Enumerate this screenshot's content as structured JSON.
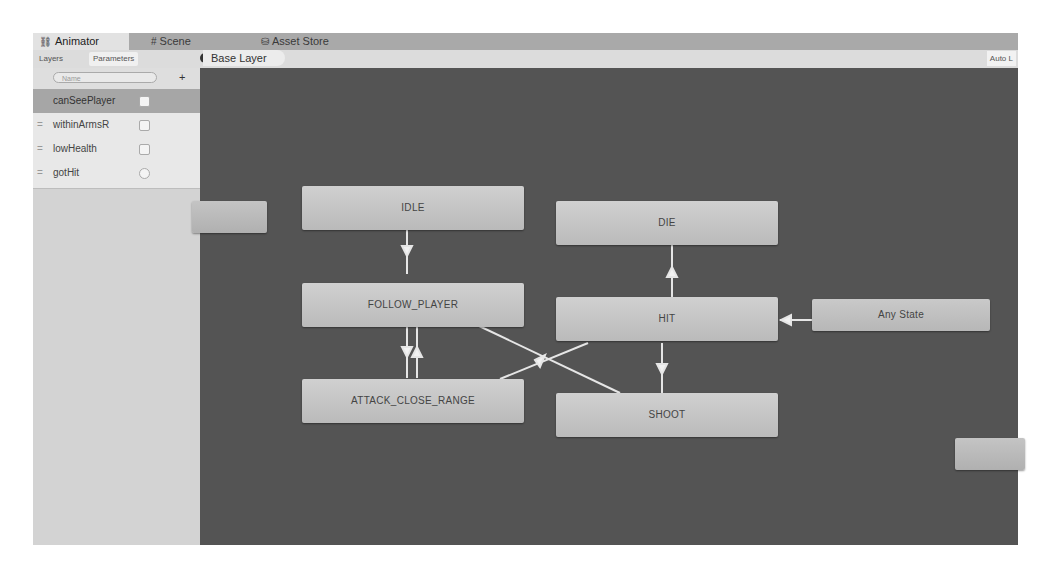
{
  "window": {
    "tabs": [
      {
        "label": "Animator",
        "icon": "animator-icon",
        "active": true
      },
      {
        "label": "Scene",
        "icon": "scene-icon",
        "active": false
      },
      {
        "label": "Asset Store",
        "icon": "asset-store-icon",
        "active": false
      }
    ]
  },
  "toolbar": {
    "subtabs": [
      {
        "label": "Layers",
        "active": false
      },
      {
        "label": "Parameters",
        "active": true
      }
    ],
    "eye_icon": "eye-icon",
    "breadcrumb": "Base Layer",
    "auto_live_label": "Auto L"
  },
  "sidebar": {
    "search_placeholder": "Name",
    "add_label": "+",
    "parameters": [
      {
        "name": "canSeePlayer",
        "type": "bool",
        "selected": true
      },
      {
        "name": "withinArmsR",
        "type": "bool",
        "selected": false
      },
      {
        "name": "lowHealth",
        "type": "bool",
        "selected": false
      },
      {
        "name": "gotHit",
        "type": "trigger",
        "selected": false
      }
    ]
  },
  "canvas": {
    "states": [
      {
        "id": "idle",
        "label": "IDLE"
      },
      {
        "id": "follow",
        "label": "FOLLOW_PLAYER"
      },
      {
        "id": "attack",
        "label": "ATTACK_CLOSE_RANGE"
      },
      {
        "id": "die",
        "label": "DIE"
      },
      {
        "id": "hit",
        "label": "HIT"
      },
      {
        "id": "shoot",
        "label": "SHOOT"
      },
      {
        "id": "any",
        "label": "Any State"
      },
      {
        "id": "offscreen-left",
        "label": ""
      },
      {
        "id": "offscreen-right",
        "label": ""
      }
    ],
    "transitions": [
      {
        "from": "IDLE",
        "to": "FOLLOW_PLAYER"
      },
      {
        "from": "FOLLOW_PLAYER",
        "to": "ATTACK_CLOSE_RANGE"
      },
      {
        "from": "ATTACK_CLOSE_RANGE",
        "to": "FOLLOW_PLAYER"
      },
      {
        "from": "HIT",
        "to": "DIE"
      },
      {
        "from": "HIT",
        "to": "SHOOT"
      },
      {
        "from": "Any State",
        "to": "HIT"
      },
      {
        "from": "FOLLOW_PLAYER",
        "to": "SHOOT"
      },
      {
        "from": "ATTACK_CLOSE_RANGE",
        "to": "HIT"
      }
    ]
  }
}
